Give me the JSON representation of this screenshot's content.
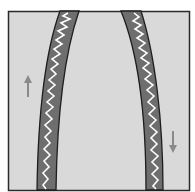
{
  "diagram": {
    "colors": {
      "background": "#d9d9d9",
      "border": "#2a2a2a",
      "band": "#6e6e6e",
      "zigzag": "#ffffff",
      "arrow": "#8a8a8a"
    },
    "arrows": [
      {
        "name": "up-arrow",
        "direction": "up"
      },
      {
        "name": "down-arrow",
        "direction": "down"
      }
    ]
  }
}
